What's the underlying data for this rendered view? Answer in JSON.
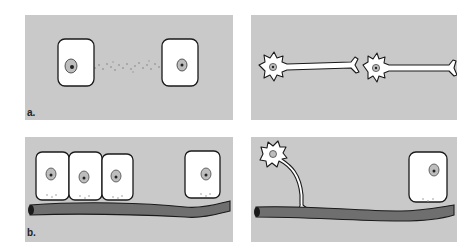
{
  "figure": {
    "panels": [
      {
        "id": "a-left",
        "label": "a.",
        "content": "two epithelial cells exchanging diffusing signal molecules"
      },
      {
        "id": "a-right",
        "label": "",
        "content": "two neurons with axons"
      },
      {
        "id": "b-left",
        "label": "b.",
        "content": "epithelial cells resting on blood vessel"
      },
      {
        "id": "b-right",
        "label": "",
        "content": "neuron axon contacting blood vessel next to a cell"
      }
    ],
    "colors": {
      "panel_background": "#c9c9c9",
      "cell_fill": "#ffffff",
      "outline": "#1a1a1a",
      "vessel_fill": "#6f6f6f",
      "nucleus_fill": "#bdbdbd"
    }
  }
}
